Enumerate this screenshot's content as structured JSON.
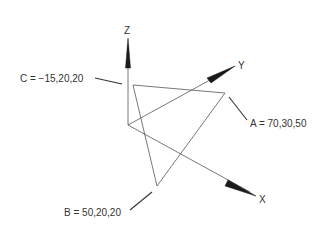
{
  "diagram": {
    "type": "3d-coordinate-triangle",
    "axes": [
      {
        "name": "Z",
        "label": "Z"
      },
      {
        "name": "Y",
        "label": "Y"
      },
      {
        "name": "X",
        "label": "X"
      }
    ],
    "points": [
      {
        "name": "A",
        "label": "A = 70,30,50",
        "coords": [
          70,
          30,
          50
        ]
      },
      {
        "name": "B",
        "label": "B = 50,20,20",
        "coords": [
          50,
          20,
          20
        ]
      },
      {
        "name": "C",
        "label": "C = −15,20,20",
        "coords": [
          -15,
          20,
          20
        ]
      }
    ],
    "colors": {
      "line": "#555555",
      "arrow": "#1a1a1a",
      "text": "#333333",
      "background": "#ffffff"
    }
  }
}
